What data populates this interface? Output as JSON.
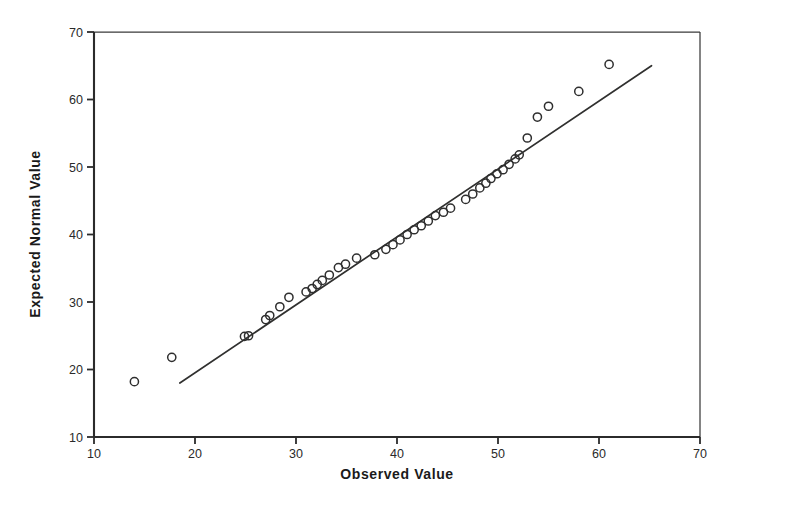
{
  "chart_data": {
    "type": "scatter",
    "title": "",
    "subtitle": "",
    "xlabel": "Observed Value",
    "ylabel": "Expected Normal Value",
    "xlim": [
      10,
      70
    ],
    "ylim": [
      10,
      70
    ],
    "xticks": [
      10,
      20,
      30,
      40,
      50,
      60,
      70
    ],
    "yticks": [
      10,
      20,
      30,
      40,
      50,
      60,
      70
    ],
    "xtick_labels": [
      "10",
      "20",
      "30",
      "40",
      "50",
      "60",
      "70"
    ],
    "ytick_labels": [
      "10",
      "20",
      "30",
      "40",
      "50",
      "60",
      "70"
    ],
    "grid": false,
    "legend": false,
    "legend_position": "none",
    "marker_style": "open-circle",
    "series": [
      {
        "name": "Expected Normal Value vs Observed Value",
        "x": [
          14.0,
          17.7,
          24.9,
          25.3,
          27.0,
          27.4,
          28.4,
          29.3,
          31.0,
          31.6,
          32.1,
          32.6,
          33.3,
          34.2,
          34.9,
          36.0,
          37.8,
          38.9,
          39.6,
          40.3,
          41.0,
          41.7,
          42.4,
          43.1,
          43.8,
          44.6,
          45.3,
          46.8,
          47.5,
          48.2,
          48.8,
          49.3,
          49.9,
          50.5,
          51.1,
          51.7,
          52.1,
          52.9,
          53.9,
          55.0,
          58.0,
          61.0
        ],
        "y": [
          18.2,
          21.8,
          24.9,
          25.0,
          27.4,
          28.0,
          29.3,
          30.7,
          31.5,
          32.0,
          32.6,
          33.2,
          34.0,
          35.1,
          35.6,
          36.5,
          37.0,
          37.8,
          38.5,
          39.2,
          40.0,
          40.7,
          41.3,
          42.0,
          42.8,
          43.3,
          43.9,
          45.2,
          46.0,
          46.9,
          47.6,
          48.3,
          49.0,
          49.6,
          50.4,
          51.2,
          51.8,
          54.3,
          57.4,
          59.0,
          61.2,
          65.2
        ]
      }
    ],
    "reference_line": {
      "name": "normal-reference-line",
      "x_start": 18.5,
      "y_start": 18.0,
      "x_end": 65.2,
      "y_end": 65.0
    }
  },
  "axes": {
    "x_axis_name": "Observed Value",
    "y_axis_name": "Expected Normal Value"
  }
}
